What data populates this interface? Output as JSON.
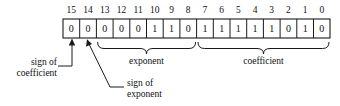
{
  "diagram": {
    "bit_field": {
      "name": "bit-field-register",
      "bit_numbers": [
        "15",
        "14",
        "13",
        "12",
        "11",
        "10",
        "9",
        "8",
        "7",
        "6",
        "5",
        "4",
        "3",
        "2",
        "1",
        "0"
      ],
      "bit_values": [
        "0",
        "0",
        "0",
        "0",
        "0",
        "1",
        "1",
        "0",
        "1",
        "1",
        "1",
        "1",
        "1",
        "0",
        "1",
        "0"
      ]
    },
    "annotations": [
      {
        "id": "sign-of-coefficient",
        "line1": "sign of",
        "line2": "coefficient",
        "points_to_bit": "15"
      },
      {
        "id": "sign-of-exponent",
        "line1": "sign of",
        "line2": "exponent",
        "points_to_bit": "14"
      }
    ],
    "field_groups": [
      {
        "id": "exponent",
        "label": "exponent",
        "bits_from": "13",
        "bits_to": "8"
      },
      {
        "id": "coefficient",
        "label": "coefficient",
        "bits_from": "7",
        "bits_to": "0"
      }
    ],
    "colors": {
      "background": "#ffffff",
      "stroke": "#1a1a1a",
      "text": "#111111"
    }
  }
}
